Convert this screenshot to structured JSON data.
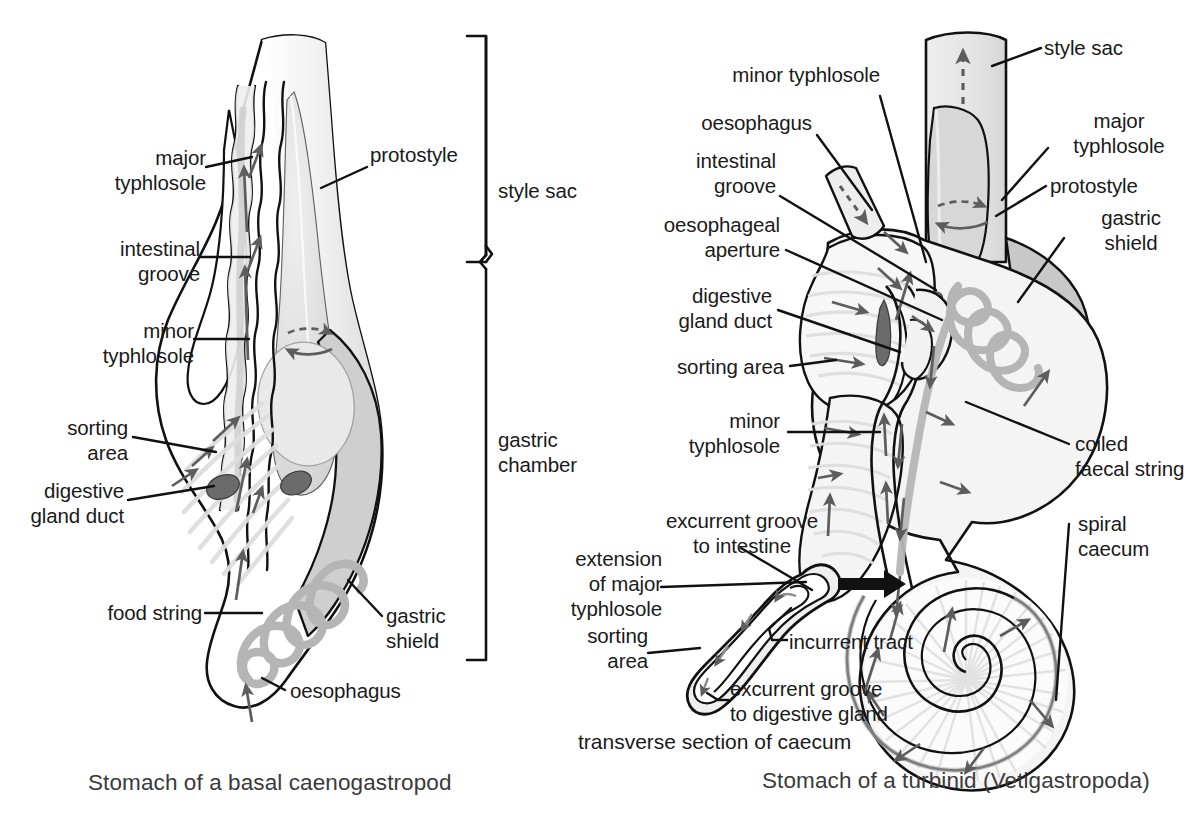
{
  "figure": {
    "left_panel": {
      "caption": "Stomach of a basal caenogastropod",
      "labels": {
        "major_typhlosole": "major\ntyphlosole",
        "intestinal_groove": "intestinal\ngroove",
        "minor_typhlosole": "minor\ntyphlosole",
        "protostyle": "protostyle",
        "sorting_area": "sorting\narea",
        "digestive_gland_duct": "digestive\ngland duct",
        "food_string": "food string",
        "oesophagus": "oesophagus",
        "gastric_shield": "gastric\nshield"
      },
      "brackets": {
        "style_sac": "style sac",
        "gastric_chamber": "gastric\nchamber"
      }
    },
    "right_panel": {
      "caption": "Stomach of a turbinid (Vetigastropoda)",
      "labels": {
        "minor_typhlosole_top": "minor typhlosole",
        "oesophagus": "oesophagus",
        "intestinal_groove": "intestinal\ngroove",
        "oesophageal_aperture": "oesophageal\naperture",
        "digestive_gland_duct": "digestive\ngland duct",
        "sorting_area": "sorting area",
        "minor_typhlosole": "minor\ntyphlosole",
        "style_sac": "style sac",
        "major_typhlosole": "major\ntyphlosole",
        "protostyle": "protostyle",
        "gastric_shield": "gastric\nshield",
        "coiled_faecal_string": "coiled\nfaecal string",
        "spiral_caecum": "spiral\ncaecum"
      }
    },
    "inset": {
      "caption": "transverse section of caecum",
      "labels": {
        "excurrent_groove_to_intestine": "excurrent groove\nto intestine",
        "extension_of_major_typhlosole": "extension\nof major\ntyphlosole",
        "sorting_area": "sorting\narea",
        "incurrent_tract": "incurrent tract",
        "excurrent_groove_to_digestive_gland": "excurrent groove\nto digestive gland"
      }
    },
    "colors": {
      "outline": "#111111",
      "background": "#ffffff",
      "fill_light": "#f0f0f0",
      "fill_mid": "#d9d9d9",
      "fill_dark": "#9a9a9a",
      "duct_dark": "#6b6b6b",
      "faecal_string": "#b5b5b5",
      "arrow_gray": "#5d5d5d",
      "caption_gray": "#3a3a3a"
    }
  }
}
